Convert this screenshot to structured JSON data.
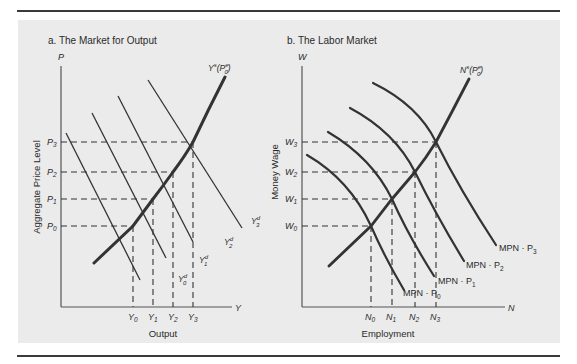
{
  "figure": {
    "panels": [
      {
        "id": "a",
        "title": "a.  The Market for Output",
        "y_axis_symbol": "P",
        "x_axis_symbol": "Y",
        "y_axis_label": "Aggregate Price Level",
        "x_axis_label": "Output",
        "supply_label": {
          "main": "Y",
          "sup": "s",
          "arg": "(P",
          "arg_sup": "e",
          "arg_sub": "0",
          "close": ")"
        },
        "y_ticks": [
          {
            "main": "P",
            "sub": "3"
          },
          {
            "main": "P",
            "sub": "2"
          },
          {
            "main": "P",
            "sub": "1"
          },
          {
            "main": "P",
            "sub": "0"
          }
        ],
        "x_ticks": [
          {
            "main": "Y",
            "sub": "0"
          },
          {
            "main": "Y",
            "sub": "1"
          },
          {
            "main": "Y",
            "sub": "2"
          },
          {
            "main": "Y",
            "sub": "3"
          }
        ],
        "demand_labels": [
          {
            "main": "Y",
            "sup": "d",
            "sub": "0"
          },
          {
            "main": "Y",
            "sup": "d",
            "sub": "1"
          },
          {
            "main": "Y",
            "sup": "d",
            "sub": "2"
          },
          {
            "main": "Y",
            "sup": "d",
            "sub": "3"
          }
        ]
      },
      {
        "id": "b",
        "title": "b.  The Labor Market",
        "y_axis_symbol": "W",
        "x_axis_symbol": "N",
        "y_axis_label": "Money Wage",
        "x_axis_label": "Employment",
        "supply_label": {
          "main": "N",
          "sup": "s",
          "arg": "(P",
          "arg_sup": "e",
          "arg_sub": "0",
          "close": ")"
        },
        "y_ticks": [
          {
            "main": "W",
            "sub": "3"
          },
          {
            "main": "W",
            "sub": "2"
          },
          {
            "main": "W",
            "sub": "1"
          },
          {
            "main": "W",
            "sub": "0"
          }
        ],
        "x_ticks": [
          {
            "main": "N",
            "sub": "0"
          },
          {
            "main": "N",
            "sub": "1"
          },
          {
            "main": "N",
            "sub": "2"
          },
          {
            "main": "N",
            "sub": "3"
          }
        ],
        "demand_labels": [
          {
            "main": "MPN · P",
            "sub": "0"
          },
          {
            "main": "MPN · P",
            "sub": "1"
          },
          {
            "main": "MPN · P",
            "sub": "2"
          },
          {
            "main": "MPN · P",
            "sub": "3"
          }
        ]
      }
    ],
    "colors": {
      "panel_bg": "#ebebeb",
      "line": "#333333",
      "rule": "#3a3a3a"
    }
  }
}
